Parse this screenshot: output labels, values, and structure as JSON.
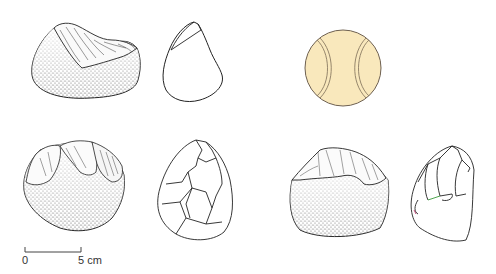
{
  "figure": {
    "type": "archaeological-illustration",
    "tools": [
      {
        "id": "tool-1",
        "views": [
          "stippled-face-view",
          "outline-profile-view"
        ]
      },
      {
        "id": "tool-2",
        "views": [
          "stippled-face-view",
          "outline-flake-scar-view"
        ]
      },
      {
        "id": "tool-3",
        "views": [
          "stippled-face-view",
          "outline-flake-scar-view"
        ]
      }
    ],
    "reference_object": {
      "name": "tennis ball",
      "fill": "#f9e8bc",
      "stroke": "#7a6a55"
    }
  },
  "scale_bar": {
    "start_label": "0",
    "end_label": "5 cm"
  },
  "colors": {
    "line": "#222222",
    "stipple": "#333333",
    "ball_fill": "#f9e8bc",
    "ball_seam": "#8a7a62"
  }
}
